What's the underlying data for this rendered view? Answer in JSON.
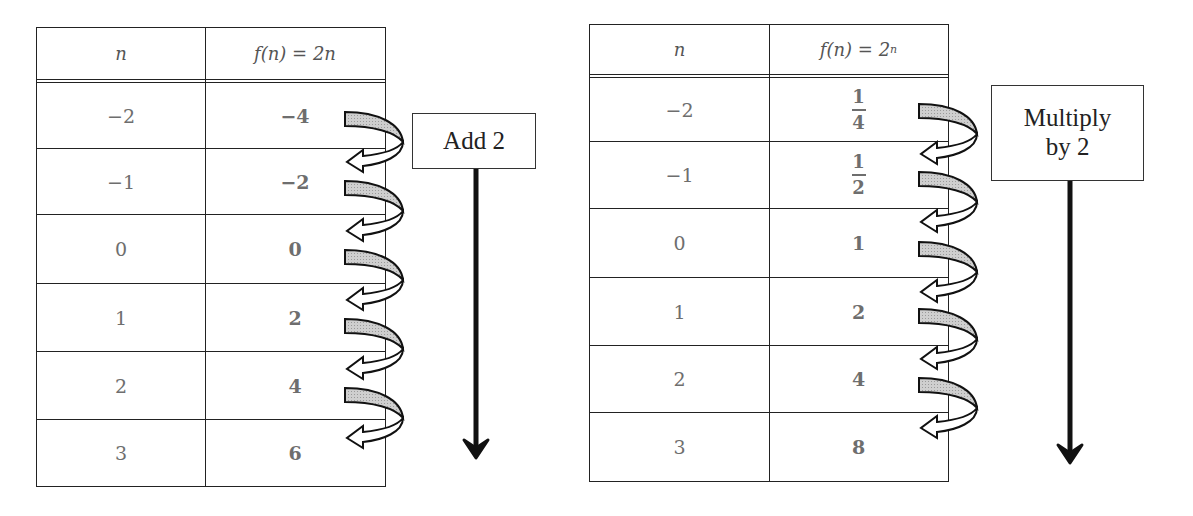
{
  "diagrams": [
    {
      "header": {
        "n": "n",
        "f": "f(n) = 2n"
      },
      "rows": [
        {
          "n": "−2",
          "f": "−4"
        },
        {
          "n": "−1",
          "f": "−2"
        },
        {
          "n": "0",
          "f": "0"
        },
        {
          "n": "1",
          "f": "2"
        },
        {
          "n": "2",
          "f": "4"
        },
        {
          "n": "3",
          "f": "6"
        }
      ],
      "operation_label": "Add 2"
    },
    {
      "header": {
        "n": "n",
        "f_base": "f(n) = 2",
        "f_exp": "n"
      },
      "rows": [
        {
          "n": "−2",
          "f_num": "1",
          "f_den": "4"
        },
        {
          "n": "−1",
          "f_num": "1",
          "f_den": "2"
        },
        {
          "n": "0",
          "f": "1"
        },
        {
          "n": "1",
          "f": "2"
        },
        {
          "n": "2",
          "f": "4"
        },
        {
          "n": "3",
          "f": "8"
        }
      ],
      "operation_label_line1": "Multiply",
      "operation_label_line2": "by 2"
    }
  ],
  "colors": {
    "arrow_fill": "#c8c8c8",
    "line": "#222222",
    "value_text": "#6e6e6e"
  }
}
